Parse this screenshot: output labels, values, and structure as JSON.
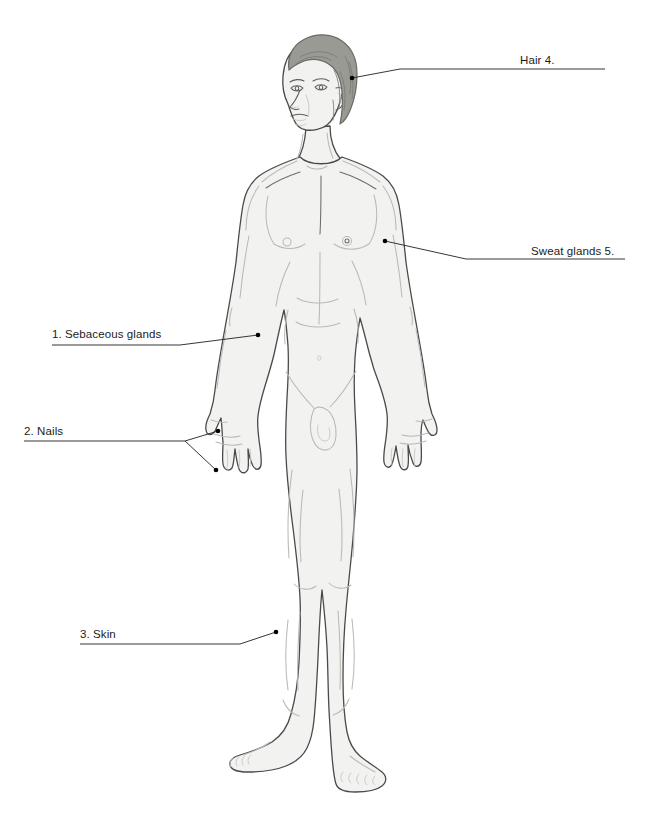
{
  "figure": {
    "background_color": "#ffffff",
    "skin_fill": "#f2f2f0",
    "skin_outline": "#4a4a4a",
    "skin_shading": "#b8b8b4",
    "hair_fill": "#9a9a95",
    "hair_outline": "#6a6a66",
    "hair_strand": "#7a7a75",
    "leader_line_color": "#2b2b2b",
    "leader_dot_color": "#000000",
    "label_text_color": "#1b1b1b"
  },
  "callouts": [
    {
      "id": "sebaceous-glands",
      "number": "1.",
      "name": "Sebaceous glands",
      "text": "1. Sebaceous glands",
      "side": "left",
      "anchor_x": 258,
      "anchor_y": 335
    },
    {
      "id": "nails",
      "number": "2.",
      "name": "Nails",
      "text": "2. Nails",
      "side": "left",
      "anchor_x": 218,
      "anchor_y": 431,
      "second_anchor_x": 216,
      "second_anchor_y": 470
    },
    {
      "id": "skin",
      "number": "3.",
      "name": "Skin",
      "text": "3. Skin",
      "side": "left",
      "anchor_x": 276,
      "anchor_y": 632
    },
    {
      "id": "hair",
      "number": "4.",
      "name": "Hair",
      "text": "Hair 4.",
      "side": "right",
      "anchor_x": 352,
      "anchor_y": 78
    },
    {
      "id": "sweat-glands",
      "number": "5.",
      "name": "Sweat glands",
      "text": "Sweat glands 5.",
      "side": "right",
      "anchor_x": 385,
      "anchor_y": 241
    }
  ],
  "canvas": {
    "width": "655",
    "height": "831"
  }
}
